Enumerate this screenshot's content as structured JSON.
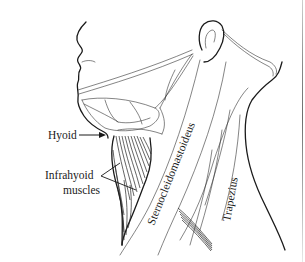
{
  "figure": {
    "colors": {
      "ink": "#1a1a1a",
      "background": "#ffffff"
    },
    "labels": {
      "hyoid": "Hyoid",
      "infrahyoid_line1": "Infrahyoid",
      "infrahyoid_line2": "muscles",
      "sternocleidomastoideus": "Sternocleidomastoideus",
      "trapezius": "Trapezius"
    }
  }
}
